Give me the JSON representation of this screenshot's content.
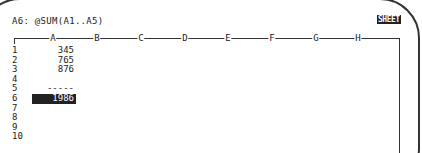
{
  "status_line": {
    "cell": "A6",
    "formula": "@SUM(A1..A5)",
    "text": "A6: @SUM(A1..A5)"
  },
  "mode_indicator": "SHEET",
  "columns": [
    "A",
    "B",
    "C",
    "D",
    "E",
    "F",
    "G",
    "H"
  ],
  "rows": [
    "1",
    "2",
    "3",
    "4",
    "5",
    "6",
    "7",
    "8",
    "9",
    "10"
  ],
  "cells": {
    "A1": "345",
    "A2": "765",
    "A3": "876",
    "A5": "-----",
    "A6": "1986"
  },
  "selected_cell": "A6"
}
